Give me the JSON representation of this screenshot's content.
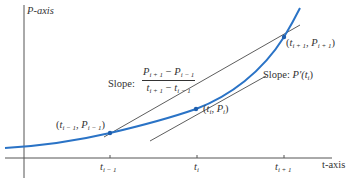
{
  "diagram": {
    "axes": {
      "y_label": "P-axis",
      "x_label": "t-axis"
    },
    "ticks": [
      {
        "label_main": "t",
        "label_sub": "i − 1",
        "x": 110
      },
      {
        "label_main": "t",
        "label_sub": "i",
        "x": 197
      },
      {
        "label_main": "t",
        "label_sub": "i + 1",
        "x": 284
      }
    ],
    "points": [
      {
        "id": "prev",
        "label": "(t_{i-1}, P_{i-1})",
        "t_sub": "i − 1",
        "p_sub": "i − 1",
        "x": 110,
        "y": 133
      },
      {
        "id": "curr",
        "label": "(t_i, P_i)",
        "t_sub": "i",
        "p_sub": "i",
        "x": 196,
        "y": 109
      },
      {
        "id": "next",
        "label": "(t_{i+1}, P_{i+1})",
        "t_sub": "i + 1",
        "p_sub": "i + 1",
        "x": 284,
        "y": 37
      }
    ],
    "secant_label": {
      "prefix": "Slope:",
      "numerator_a": "P",
      "numerator_a_sub": "i + 1",
      "minus": "−",
      "numerator_b": "P",
      "numerator_b_sub": "i − 1",
      "denominator_a": "t",
      "denominator_a_sub": "i + 1",
      "denominator_b": "t",
      "denominator_b_sub": "i − 1"
    },
    "tangent_label": {
      "prefix": "Slope:",
      "expr": "P′(t",
      "sub": "i",
      "close": ")"
    },
    "colors": {
      "curve": "#2a73c6",
      "lines": "#333333",
      "axes": "#444444",
      "point": "#1f5fae"
    }
  }
}
